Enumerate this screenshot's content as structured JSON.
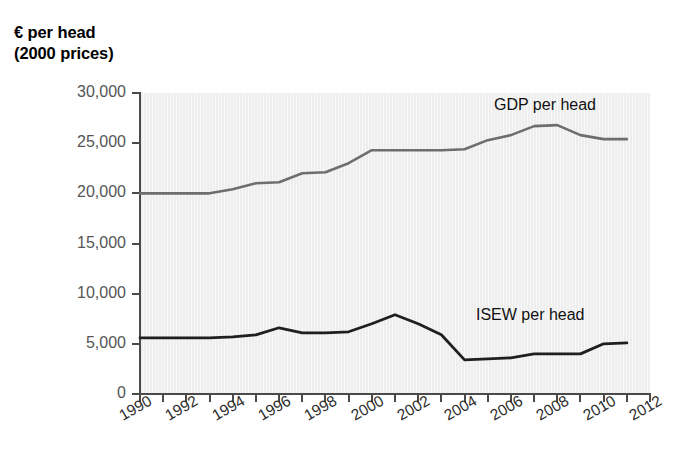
{
  "axis_title": "€ per head\n(2000 prices)",
  "chart_data": {
    "type": "line",
    "title": "€ per head (2000 prices)",
    "xlabel": "",
    "ylabel": "€ per head (2000 prices)",
    "xlim": [
      1990,
      2012
    ],
    "ylim": [
      0,
      30000
    ],
    "grid": false,
    "legend": "inline-labels",
    "ytick_labels": [
      "30,000",
      "25,000",
      "20,000",
      "15,000",
      "10,000",
      "5,000",
      "0"
    ],
    "ytick_values": [
      30000,
      25000,
      20000,
      15000,
      10000,
      5000,
      0
    ],
    "xtick_labels": [
      "1990",
      "1992",
      "1994",
      "1996",
      "1998",
      "2000",
      "2002",
      "2004",
      "2006",
      "2008",
      "2010",
      "2012"
    ],
    "xtick_values": [
      1990,
      1992,
      1994,
      1996,
      1998,
      2000,
      2002,
      2004,
      2006,
      2008,
      2010,
      2012
    ],
    "minor_xticks": [
      1990,
      1991,
      1992,
      1993,
      1994,
      1995,
      1996,
      1997,
      1998,
      1999,
      2000,
      2001,
      2002,
      2003,
      2004,
      2005,
      2006,
      2007,
      2008,
      2009,
      2010,
      2011,
      2012
    ],
    "x": [
      1990,
      1991,
      1992,
      1993,
      1994,
      1995,
      1996,
      1997,
      1998,
      1999,
      2000,
      2001,
      2002,
      2003,
      2004,
      2005,
      2006,
      2007,
      2008,
      2009,
      2010,
      2011
    ],
    "series": [
      {
        "name": "GDP per head",
        "color": "#6e6e6e",
        "label_position": {
          "x": 494,
          "y": 96
        },
        "values": [
          20000,
          20000,
          20000,
          20000,
          20400,
          21000,
          21100,
          22000,
          22100,
          23000,
          24300,
          24300,
          24300,
          24300,
          24400,
          25300,
          25800,
          26700,
          26800,
          25800,
          25400,
          25400
        ]
      },
      {
        "name": "ISEW per head",
        "color": "#1f1f1f",
        "label_position": {
          "x": 476,
          "y": 306
        },
        "values": [
          5600,
          5600,
          5600,
          5600,
          5700,
          5900,
          6600,
          6100,
          6100,
          6200,
          7000,
          7900,
          7000,
          5900,
          3400,
          3500,
          3600,
          4000,
          4000,
          4000,
          5000,
          5100
        ]
      }
    ]
  }
}
